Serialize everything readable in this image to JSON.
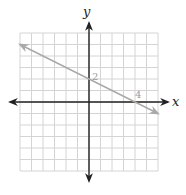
{
  "chart_data": {
    "type": "line",
    "title": "",
    "xlabel": "x",
    "ylabel": "y",
    "xlim": [
      -6,
      6
    ],
    "ylim": [
      -6,
      6
    ],
    "grid": true,
    "grid_step": 1,
    "series": [
      {
        "name": "line",
        "equation": "y = -x/2 + 2",
        "x": [
          -6,
          0,
          4,
          6
        ],
        "y": [
          5,
          2,
          0,
          -1
        ],
        "color": "#a9a9a9",
        "arrows": "both"
      }
    ],
    "annotations": [
      {
        "text": "2",
        "x": 0,
        "y": 2,
        "meaning": "y-intercept"
      },
      {
        "text": "4",
        "x": 4,
        "y": 0,
        "meaning": "x-intercept"
      }
    ]
  },
  "labels": {
    "x_axis": "x",
    "y_axis": "y",
    "y_intercept": "2",
    "x_intercept": "4"
  },
  "colors": {
    "grid": "#d4d4d4",
    "axis": "#222222",
    "line": "#a9a9a9"
  }
}
